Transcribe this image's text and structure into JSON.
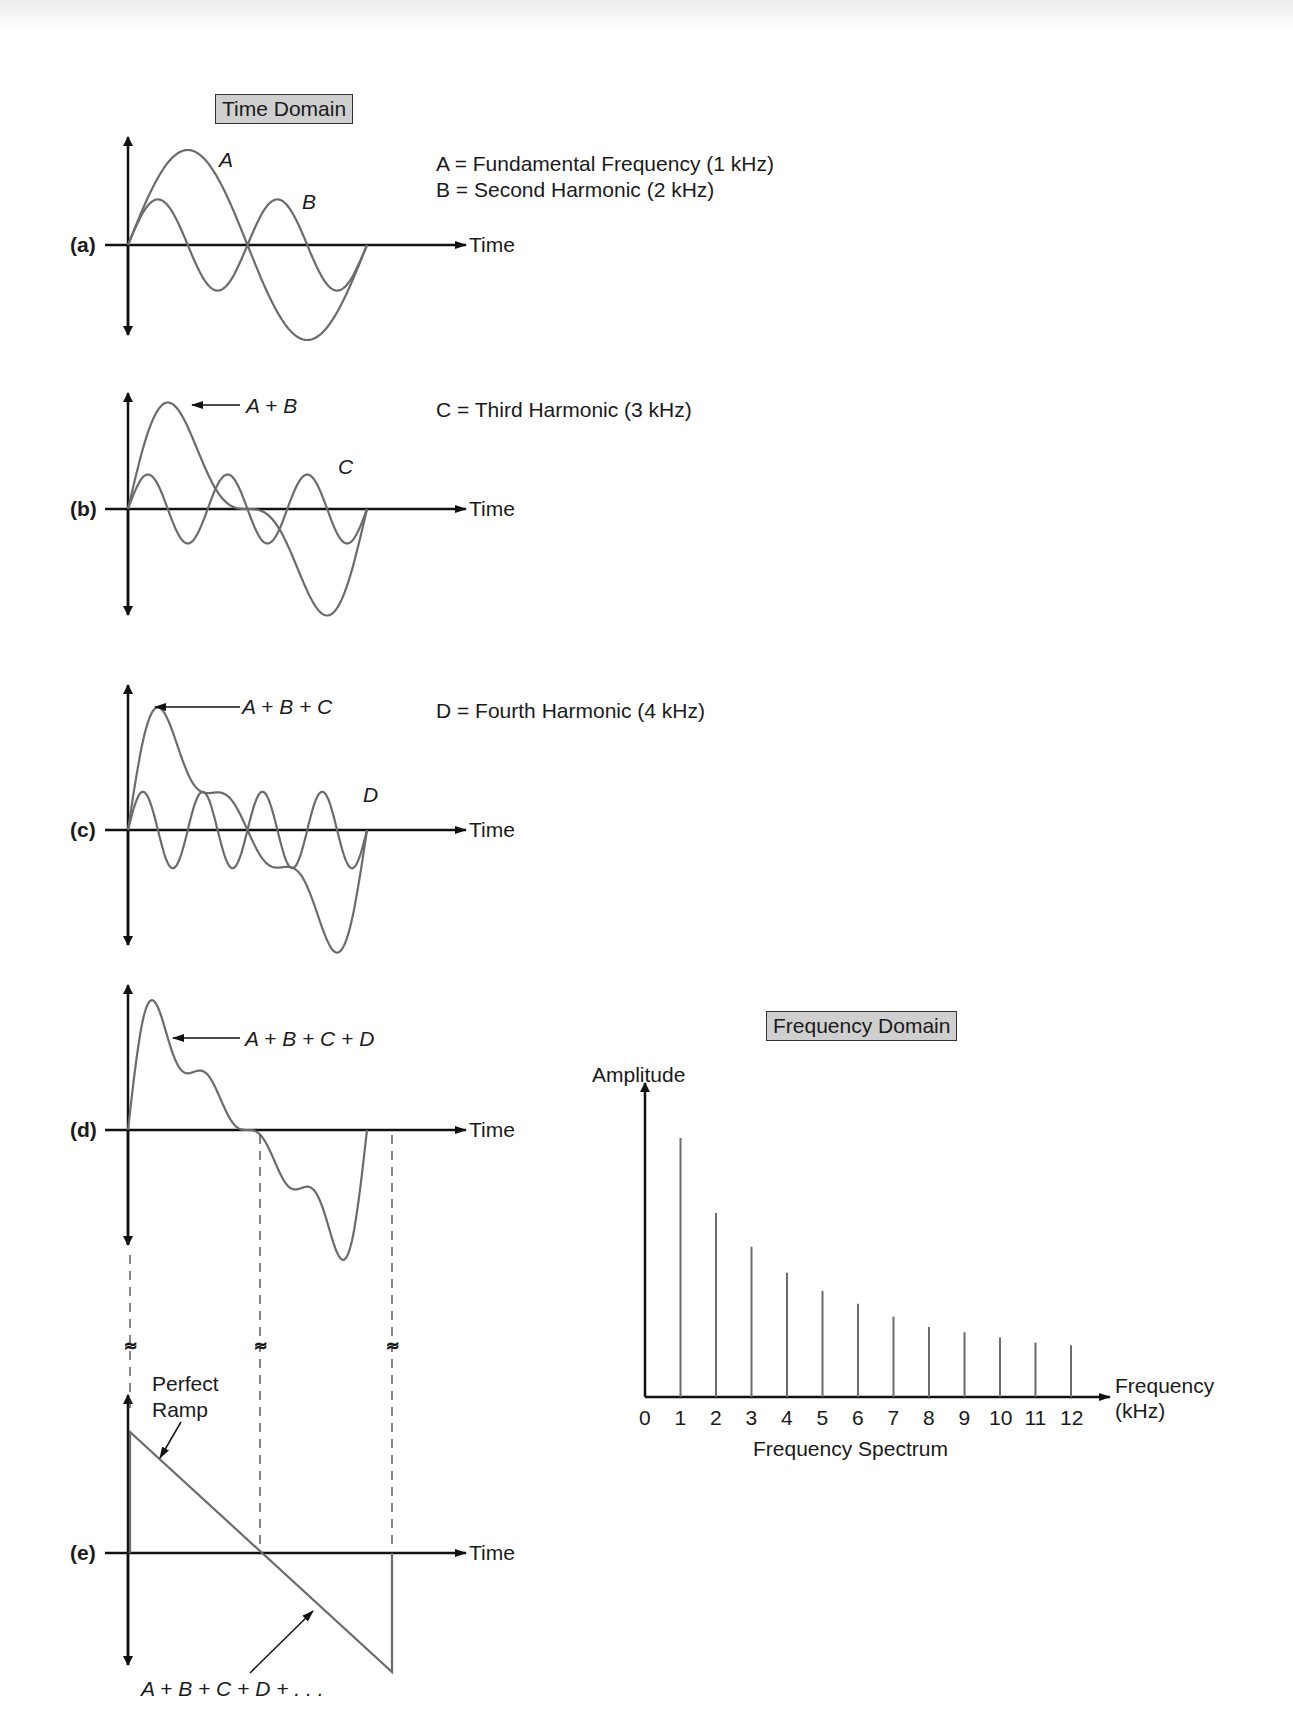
{
  "time_domain": {
    "title": "Time Domain",
    "axis_label": "Time",
    "panels": [
      {
        "id": "a",
        "label": "(a)",
        "curve_labels": [
          "A",
          "B"
        ]
      },
      {
        "id": "b",
        "label": "(b)",
        "curve_labels": [
          "A + B",
          "C"
        ]
      },
      {
        "id": "c",
        "label": "(c)",
        "curve_labels": [
          "A + B + C",
          "D"
        ]
      },
      {
        "id": "d",
        "label": "(d)",
        "curve_labels": [
          "A + B + C + D"
        ]
      },
      {
        "id": "e",
        "label": "(e)",
        "curve_labels": [
          "Perfect Ramp",
          "A + B + C + D + . . ."
        ]
      }
    ],
    "legend": [
      "A = Fundamental Frequency (1 kHz)",
      "B = Second Harmonic (2 kHz)",
      "C = Third Harmonic (3 kHz)",
      "D = Fourth Harmonic (4 kHz)"
    ],
    "ramp_label_line1": "Perfect",
    "ramp_label_line2": "Ramp",
    "break_symbol": "≈"
  },
  "frequency_domain": {
    "title": "Frequency Domain",
    "ylabel": "Amplitude",
    "xlabel_line1": "Frequency",
    "xlabel_line2": "(kHz)",
    "caption": "Frequency Spectrum"
  },
  "colors": {
    "axis": "#111111",
    "curve": "#6b6b6b",
    "title_box": "#cfcfcf"
  },
  "chart_data": {
    "type": "bar",
    "title": "Frequency Domain",
    "subtitle": "Frequency Spectrum",
    "xlabel": "Frequency (kHz)",
    "ylabel": "Amplitude",
    "categories": [
      "1",
      "2",
      "3",
      "4",
      "5",
      "6",
      "7",
      "8",
      "9",
      "10",
      "11",
      "12"
    ],
    "tick_labels": [
      "0",
      "1",
      "2",
      "3",
      "4",
      "5",
      "6",
      "7",
      "8",
      "9",
      "10",
      "11",
      "12"
    ],
    "values": [
      1.0,
      0.71,
      0.58,
      0.48,
      0.41,
      0.36,
      0.31,
      0.27,
      0.25,
      0.23,
      0.21,
      0.2
    ],
    "ylim": [
      0,
      1.1
    ],
    "grid": false,
    "legend": null
  }
}
